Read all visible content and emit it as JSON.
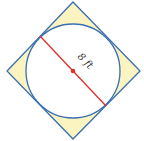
{
  "diagram": {
    "label": "8 ft",
    "colors": {
      "square_fill": "#fbf3c0",
      "outline": "#3a6fb0",
      "diameter": "#e0302a",
      "circle_fill": "#ffffff"
    },
    "shapes": [
      "square-rotated-45",
      "inscribed-circle",
      "diameter-line",
      "center-point"
    ]
  }
}
